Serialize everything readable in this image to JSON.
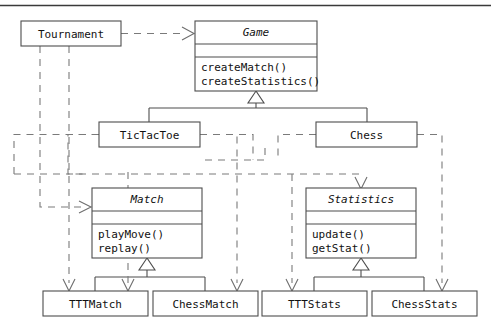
{
  "diagram": {
    "kind": "uml-class-diagram",
    "top_rule": true,
    "stroke_color": "#4d4d4d",
    "dashed_color": "#7a7a7a",
    "background": "#ffffff",
    "classes": [
      {
        "id": "tournament",
        "name": "Tournament",
        "abstract": false,
        "compartments": 1,
        "operations": [],
        "x": 21,
        "y": 21,
        "w": 100,
        "h": 25
      },
      {
        "id": "game",
        "name": "Game",
        "abstract": true,
        "compartments": 3,
        "operations": [
          "createMatch()",
          "createStatistics()"
        ],
        "x": 195,
        "y": 21,
        "w": 122,
        "h": 70
      },
      {
        "id": "tictactoe",
        "name": "TicTacToe",
        "abstract": false,
        "compartments": 1,
        "operations": [],
        "x": 99,
        "y": 122,
        "w": 101,
        "h": 25
      },
      {
        "id": "chess",
        "name": "Chess",
        "abstract": false,
        "compartments": 1,
        "operations": [],
        "x": 316,
        "y": 122,
        "w": 101,
        "h": 25
      },
      {
        "id": "match",
        "name": "Match",
        "abstract": true,
        "compartments": 3,
        "operations": [
          "playMove()",
          "replay()"
        ],
        "x": 92,
        "y": 188,
        "w": 110,
        "h": 70
      },
      {
        "id": "statistics",
        "name": "Statistics",
        "abstract": true,
        "compartments": 3,
        "operations": [
          "update()",
          "getStat()"
        ],
        "x": 306,
        "y": 188,
        "w": 110,
        "h": 70
      },
      {
        "id": "tttmatch",
        "name": "TTTMatch",
        "abstract": false,
        "compartments": 1,
        "operations": [],
        "x": 43,
        "y": 291,
        "w": 105,
        "h": 25
      },
      {
        "id": "chessmatch",
        "name": "ChessMatch",
        "abstract": false,
        "compartments": 1,
        "operations": [],
        "x": 153,
        "y": 291,
        "w": 105,
        "h": 25
      },
      {
        "id": "tttstats",
        "name": "TTTStats",
        "abstract": false,
        "compartments": 1,
        "operations": [],
        "x": 262,
        "y": 291,
        "w": 105,
        "h": 25
      },
      {
        "id": "chessstats",
        "name": "ChessStats",
        "abstract": false,
        "compartments": 1,
        "operations": [],
        "x": 372,
        "y": 291,
        "w": 105,
        "h": 25
      }
    ],
    "relationships": [
      {
        "from": "tournament",
        "to": "game",
        "type": "dependency"
      },
      {
        "from": "tictactoe",
        "to": "game",
        "type": "generalization"
      },
      {
        "from": "chess",
        "to": "game",
        "type": "generalization"
      },
      {
        "from": "tttmatch",
        "to": "match",
        "type": "generalization"
      },
      {
        "from": "chessmatch",
        "to": "match",
        "type": "generalization"
      },
      {
        "from": "tttstats",
        "to": "statistics",
        "type": "generalization"
      },
      {
        "from": "chessstats",
        "to": "statistics",
        "type": "generalization"
      },
      {
        "from": "tournament",
        "to": "match",
        "type": "dependency"
      },
      {
        "from": "tournament",
        "to": "tttmatch",
        "type": "dependency"
      },
      {
        "from": "tictactoe",
        "to": "match",
        "type": "dependency"
      },
      {
        "from": "tictactoe",
        "to": "tttmatch",
        "type": "dependency"
      },
      {
        "from": "tictactoe",
        "to": "tttstats",
        "type": "dependency"
      },
      {
        "from": "chess",
        "to": "statistics",
        "type": "dependency"
      },
      {
        "from": "chess",
        "to": "chessmatch",
        "type": "dependency"
      },
      {
        "from": "chess",
        "to": "chessstats",
        "type": "dependency"
      }
    ]
  }
}
